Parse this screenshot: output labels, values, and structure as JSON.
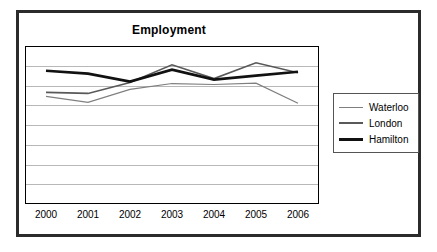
{
  "chart_data": {
    "type": "line",
    "title": "Employment",
    "xlabel": "",
    "ylabel": "",
    "categories": [
      "2000",
      "2001",
      "2002",
      "2003",
      "2004",
      "2005",
      "2006"
    ],
    "x": [
      2000,
      2001,
      2002,
      2003,
      2004,
      2005,
      2006
    ],
    "ylim": [
      0,
      8
    ],
    "grid": true,
    "gridlines": 8,
    "y_tick_labels": [],
    "legend_position": "right",
    "series": [
      {
        "name": "Waterloo",
        "color": "#7f7f7f",
        "line_width": 1.2,
        "values": [
          5.45,
          5.15,
          5.8,
          6.1,
          6.05,
          6.12,
          5.1
        ]
      },
      {
        "name": "London",
        "color": "#595959",
        "line_width": 1.6,
        "values": [
          5.65,
          5.6,
          6.15,
          7.05,
          6.35,
          7.15,
          6.65
        ]
      },
      {
        "name": "Hamilton",
        "color": "#111111",
        "line_width": 2.6,
        "values": [
          6.75,
          6.6,
          6.2,
          6.8,
          6.3,
          6.5,
          6.7
        ]
      }
    ]
  },
  "legend": {
    "entries": [
      {
        "label": "Waterloo"
      },
      {
        "label": "London"
      },
      {
        "label": "Hamilton"
      }
    ]
  },
  "axis": {
    "x_ticks": [
      "2000",
      "2001",
      "2002",
      "2003",
      "2004",
      "2005",
      "2006"
    ]
  },
  "colors": {
    "frame_border": "#2b2b2b",
    "plot_border": "#000000",
    "gridline": "#b8b8b8",
    "legend_border": "#555555",
    "background": "#ffffff"
  }
}
